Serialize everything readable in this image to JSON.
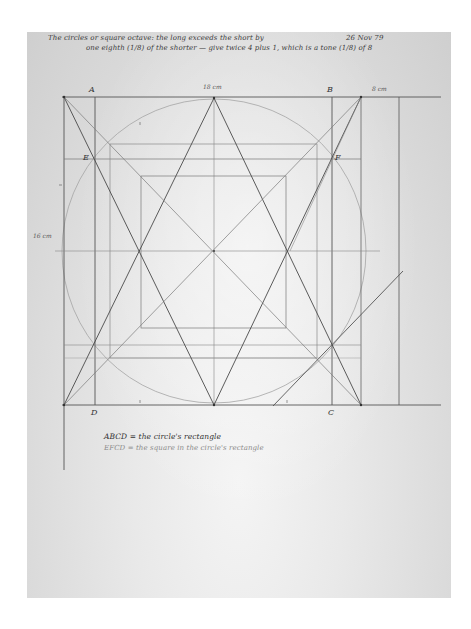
{
  "notes": {
    "line1": "The circles or square octave: the long exceeds the short by",
    "line2": "one eighth (1/8) of the shorter — give twice 4 plus 1, which is a tone (1/8) of 8",
    "date": "26 Nov 79"
  },
  "labels": {
    "A": "A",
    "B": "B",
    "C": "C",
    "D": "D",
    "E": "E",
    "F": "F"
  },
  "dimensions": {
    "top": "18 cm",
    "right": "8 cm",
    "left": "16 cm"
  },
  "legend": {
    "line1": "ABCD = the circle's rectangle",
    "line2": "EFCD = the square in the circle's rectangle"
  },
  "colors": {
    "paper": "#dddddd",
    "background": "#ffffff",
    "strong_line": "#4a4a4a",
    "medium_line": "#6e6e6e",
    "faint_line": "#a0a0a0",
    "ink": "#333333"
  },
  "geometry": {
    "outer_rect": {
      "x1": 64,
      "y1": 97,
      "x2": 361,
      "y2": 405
    },
    "A_x": 95,
    "B_x": 332,
    "EF_y": 159,
    "apex": {
      "x": 214,
      "y": 98
    },
    "center": {
      "x": 214,
      "y": 251
    },
    "circle_radius": 152,
    "middle_square": {
      "x1": 110,
      "y1": 144,
      "x2": 317,
      "y2": 358
    },
    "inner_square": {
      "x1": 141,
      "y1": 176,
      "x2": 286,
      "y2": 328
    },
    "right_extra_vertical_x": 399,
    "extension_end_x": 441
  }
}
